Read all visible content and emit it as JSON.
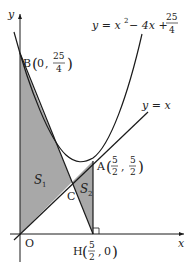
{
  "diagram": {
    "axes": {
      "x_label": "x",
      "y_label": "y",
      "origin_label": "O"
    },
    "curves": {
      "parabola": {
        "lhs": "y = x",
        "exp": "2",
        "rhs": " − 4x + ",
        "frac_num": "25",
        "frac_den": "4"
      },
      "line": {
        "label": "y = x"
      }
    },
    "points": {
      "A": {
        "name": "A",
        "x_num": "5",
        "x_den": "2",
        "y_num": "5",
        "y_den": "2"
      },
      "B": {
        "name": "B",
        "x": "0",
        "y_num": "25",
        "y_den": "4"
      },
      "C": {
        "name": "C"
      },
      "H": {
        "name": "H",
        "x_num": "5",
        "x_den": "2",
        "y": "0"
      }
    },
    "regions": {
      "S1": {
        "name": "S",
        "sub": "1"
      },
      "S2": {
        "name": "S",
        "sub": "2"
      }
    },
    "colors": {
      "shade": "#a8a8a8",
      "stroke": "#1a1a1a"
    }
  }
}
